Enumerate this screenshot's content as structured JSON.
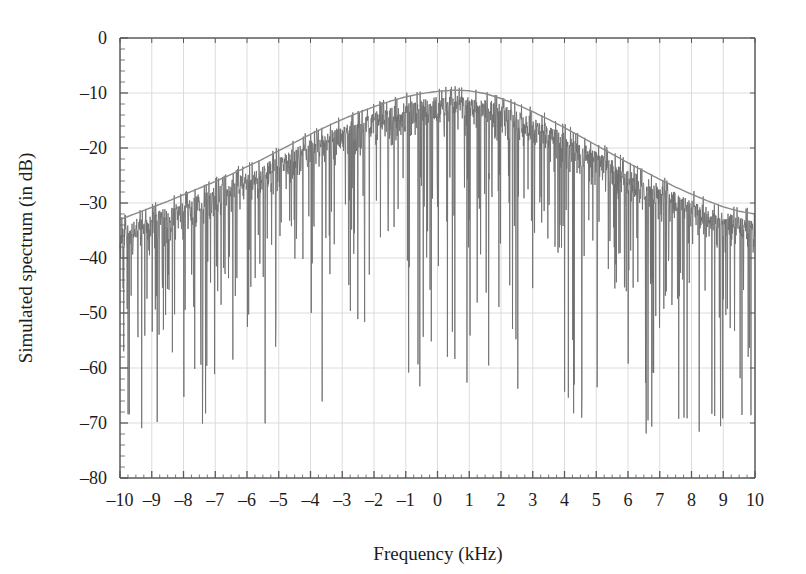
{
  "chart_data": {
    "type": "line",
    "title": "",
    "xlabel": "Frequency (kHz)",
    "ylabel": "Simulated spectrum (in dB)",
    "xlim": [
      -10,
      10
    ],
    "ylim": [
      -80,
      0
    ],
    "grid": true,
    "legend": "none",
    "x_ticks": [
      "-10",
      "-9",
      "-8",
      "-7",
      "-6",
      "-5",
      "-4",
      "-3",
      "-2",
      "-1",
      "0",
      "1",
      "2",
      "3",
      "4",
      "5",
      "6",
      "7",
      "8",
      "9",
      "10"
    ],
    "x_tick_values": [
      -10,
      -9,
      -8,
      -7,
      -6,
      -5,
      -4,
      -3,
      -2,
      -1,
      0,
      1,
      2,
      3,
      4,
      5,
      6,
      7,
      8,
      9,
      10
    ],
    "y_ticks": [
      "0",
      "-10",
      "-20",
      "-30",
      "-40",
      "-50",
      "-60",
      "-70",
      "-80"
    ],
    "y_tick_values": [
      0,
      -10,
      -20,
      -30,
      -40,
      -50,
      -60,
      -70,
      -80
    ],
    "x_minor_tick_step": 0.25,
    "y_minor_tick_step": 2,
    "series": [
      {
        "name": "envelope",
        "type": "line",
        "color": "#8a8a8a",
        "description": "Smooth spectral envelope peaking near 0.7 kHz",
        "peak_x": 0.7,
        "peak_y": -9.5,
        "edge_left_y": -33.0,
        "edge_right_y": -32.0,
        "x": [
          -10,
          -9.5,
          -9,
          -8.5,
          -8,
          -7.5,
          -7,
          -6.5,
          -6,
          -5.5,
          -5,
          -4.5,
          -4,
          -3.5,
          -3,
          -2.5,
          -2,
          -1.5,
          -1,
          -0.5,
          0,
          0.5,
          0.7,
          1,
          1.5,
          2,
          2.5,
          3,
          3.5,
          4,
          4.5,
          5,
          5.5,
          6,
          6.5,
          7,
          7.5,
          8,
          8.5,
          9,
          9.5,
          10
        ],
        "y": [
          -33.0,
          -31.9,
          -30.8,
          -29.7,
          -28.5,
          -27.3,
          -26.1,
          -24.8,
          -23.4,
          -22.0,
          -20.5,
          -19.0,
          -17.5,
          -16.1,
          -14.8,
          -13.6,
          -12.5,
          -11.5,
          -10.7,
          -10.1,
          -9.7,
          -9.5,
          -9.5,
          -9.6,
          -10.1,
          -11.0,
          -12.1,
          -13.4,
          -14.8,
          -16.3,
          -17.9,
          -19.5,
          -21.1,
          -22.7,
          -24.2,
          -25.7,
          -27.1,
          -28.4,
          -29.6,
          -30.7,
          -31.5,
          -32.0
        ]
      },
      {
        "name": "simulated-spectrum-noise",
        "type": "line",
        "color": "#6e6e6e",
        "description": "Dense noisy simulated spectrum filling below the envelope with deep downward nulls",
        "noise_fill_depth_db": 14,
        "null_depth_min_db": -72,
        "samples": 2048
      }
    ]
  },
  "figure": {
    "background_color": "#ffffff",
    "axis_color": "#5a5a5a",
    "grid_color": "#d8d8d8",
    "trace_color": "#6e6e6e",
    "envelope_color": "#8a8a8a",
    "text_color": "#1c1c1c"
  }
}
